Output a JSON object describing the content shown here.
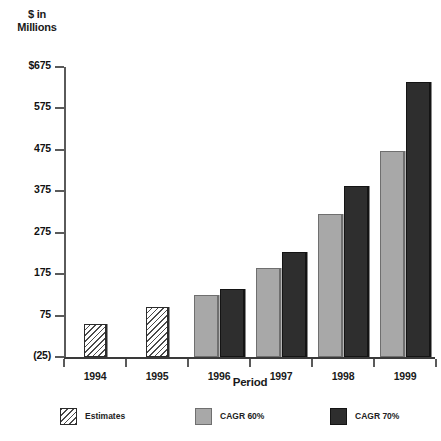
{
  "chart_data": {
    "type": "bar",
    "title": "",
    "ylabel": "$ in Millions",
    "ylabel_lines": [
      "$ in",
      "Millions"
    ],
    "xlabel": "Period",
    "categories": [
      "1994",
      "1995",
      "1996",
      "1997",
      "1998",
      "1999"
    ],
    "ytick_labels": [
      "$675",
      "575",
      "475",
      "375",
      "275",
      "175",
      "75",
      "(25)"
    ],
    "ytick_values": [
      675,
      575,
      475,
      375,
      275,
      175,
      75,
      -25
    ],
    "ylim": [
      -25,
      675
    ],
    "grid": false,
    "legend_position": "bottom",
    "series": [
      {
        "name": "Estimates",
        "color": "#ffffff",
        "pattern": "diagonal-hatch",
        "values": [
          55,
          95,
          null,
          null,
          null,
          null
        ]
      },
      {
        "name": "CAGR 60%",
        "color": "#a8a8a8",
        "pattern": "solid",
        "values": [
          null,
          null,
          125,
          190,
          320,
          472
        ]
      },
      {
        "name": "CAGR 70%",
        "color": "#2e2e2e",
        "pattern": "solid",
        "values": [
          null,
          null,
          138,
          228,
          388,
          640
        ]
      }
    ]
  },
  "axis": {
    "y_title_line1": "$ in",
    "y_title_line2": "Millions",
    "x_title": "Period"
  },
  "legend": {
    "items": [
      {
        "label": "Estimates",
        "swatch": "hatch-swatch"
      },
      {
        "label": "CAGR 60%",
        "swatch": "light-gray-swatch"
      },
      {
        "label": "CAGR 70%",
        "swatch": "dark-gray-swatch"
      }
    ]
  }
}
